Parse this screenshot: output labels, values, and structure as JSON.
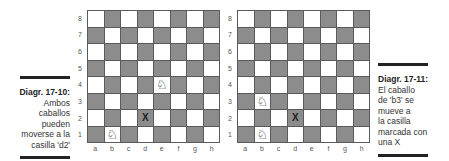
{
  "colors": {
    "dark_square": "#8c8c8c",
    "light_square": "#ffffff",
    "border": "#5a5a5a",
    "rule": "#222222"
  },
  "files": [
    "a",
    "b",
    "c",
    "d",
    "e",
    "f",
    "g",
    "h"
  ],
  "ranks": [
    "8",
    "7",
    "6",
    "5",
    "4",
    "3",
    "2",
    "1"
  ],
  "diagrams": [
    {
      "caption_title": "Diagr. 17-10:",
      "caption_lines": [
        "Ambos",
        "caballos",
        "pueden",
        "moverse a la",
        "casilla 'd2'"
      ],
      "pieces": [
        {
          "square": "e4",
          "type": "white-knight",
          "glyph": "♘"
        },
        {
          "square": "b1",
          "type": "white-knight",
          "glyph": "♘"
        }
      ],
      "marks": [
        {
          "square": "d2",
          "label": "X"
        }
      ]
    },
    {
      "caption_title": "Diagr. 17-11:",
      "caption_lines": [
        "El caballo",
        "de 'b3' se",
        "mueve a",
        "la casilla",
        "marcada con",
        "una X"
      ],
      "pieces": [
        {
          "square": "b3",
          "type": "white-knight",
          "glyph": "♘"
        },
        {
          "square": "b1",
          "type": "white-knight",
          "glyph": "♘"
        }
      ],
      "marks": [
        {
          "square": "d2",
          "label": "X"
        }
      ]
    }
  ]
}
